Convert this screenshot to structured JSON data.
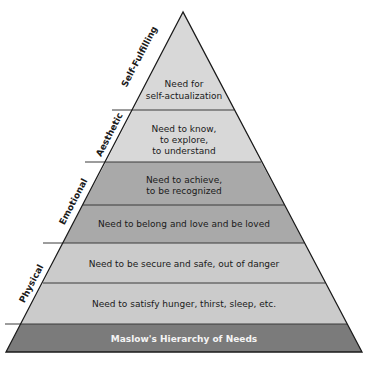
{
  "diagram": {
    "title": "Maslow's Hierarchy of Needs",
    "levels": [
      {
        "lines": [
          "Need for",
          "self-actualization"
        ],
        "color": "#d8d8d8"
      },
      {
        "lines": [
          "Need to know,",
          "to explore,",
          "to understand"
        ],
        "color": "#d8d8d8"
      },
      {
        "lines": [
          "Need to achieve,",
          "to be recognized"
        ],
        "color": "#a9a9a9"
      },
      {
        "lines": [
          "Need to belong and love and be loved"
        ],
        "color": "#a9a9a9"
      },
      {
        "lines": [
          "Need to be secure and safe, out of danger"
        ],
        "color": "#cbcbcb"
      },
      {
        "lines": [
          "Need to satisfy hunger, thirst, sleep, etc."
        ],
        "color": "#cbcbcb"
      }
    ],
    "base": {
      "label": "Maslow's Hierarchy of Needs",
      "color": "#7b7b7b"
    },
    "categories": [
      {
        "label": "Self-Fulfilling"
      },
      {
        "label": "Aesthetic"
      },
      {
        "label": "Emotional"
      },
      {
        "label": "Physical"
      }
    ]
  }
}
